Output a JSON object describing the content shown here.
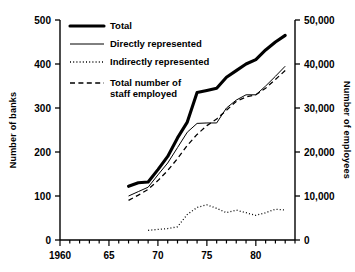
{
  "chart_data": {
    "type": "line",
    "title": "",
    "xlabel": "",
    "ylabel": "Number of banks",
    "y2label": "Number of employees",
    "xlim": [
      1960,
      1984
    ],
    "ylim": [
      0,
      500
    ],
    "y2lim": [
      0,
      50000
    ],
    "grid": false,
    "legend_position": "top-left",
    "xticks": [
      1960,
      1961,
      1962,
      1963,
      1964,
      1965,
      1966,
      1967,
      1968,
      1969,
      1970,
      1971,
      1972,
      1973,
      1974,
      1975,
      1976,
      1977,
      1978,
      1979,
      1980,
      1981,
      1982,
      1983,
      1984
    ],
    "xtick_labels": [
      "1960",
      "",
      "",
      "",
      "",
      "65",
      "",
      "",
      "",
      "",
      "70",
      "",
      "",
      "",
      "",
      "75",
      "",
      "",
      "",
      "",
      "80",
      "",
      "",
      "",
      ""
    ],
    "yticks": [
      0,
      100,
      200,
      300,
      400,
      500
    ],
    "ytick_labels": [
      "0",
      "100",
      "200",
      "300",
      "400",
      "500"
    ],
    "y2ticks": [
      0,
      10000,
      20000,
      30000,
      40000,
      50000
    ],
    "y2tick_labels": [
      "0",
      "10,000",
      "20,000",
      "30,000",
      "40,000",
      "50,000"
    ],
    "series": [
      {
        "name": "Total",
        "style": "thick-solid",
        "axis": "left",
        "x": [
          1967,
          1968,
          1969,
          1970,
          1971,
          1972,
          1973,
          1974,
          1975,
          1976,
          1977,
          1978,
          1979,
          1980,
          1981,
          1982,
          1983
        ],
        "values": [
          122,
          130,
          132,
          160,
          190,
          232,
          268,
          335,
          340,
          345,
          370,
          385,
          400,
          410,
          432,
          450,
          465
        ]
      },
      {
        "name": "Directly represented",
        "style": "thin-solid",
        "axis": "left",
        "x": [
          1967,
          1968,
          1969,
          1970,
          1971,
          1972,
          1973,
          1974,
          1975,
          1976,
          1977,
          1978,
          1979,
          1980,
          1981,
          1982,
          1983
        ],
        "values": [
          100,
          110,
          120,
          148,
          175,
          210,
          245,
          265,
          266,
          266,
          300,
          318,
          330,
          330,
          350,
          372,
          395
        ]
      },
      {
        "name": "Indirectly represented",
        "style": "dotted",
        "axis": "left",
        "x": [
          1969,
          1970,
          1971,
          1972,
          1973,
          1974,
          1975,
          1976,
          1977,
          1978,
          1979,
          1980,
          1981,
          1982,
          1983
        ],
        "values": [
          22,
          24,
          26,
          30,
          58,
          74,
          80,
          72,
          62,
          68,
          62,
          56,
          62,
          70,
          68
        ]
      },
      {
        "name": "Total number of staff employed",
        "style": "dashed",
        "axis": "right",
        "x": [
          1967,
          1968,
          1969,
          1970,
          1971,
          1972,
          1973,
          1974,
          1975,
          1976,
          1977,
          1978,
          1979,
          1980,
          1981,
          1982,
          1983
        ],
        "values": [
          9000,
          10200,
          11500,
          13500,
          15800,
          18500,
          21500,
          24000,
          26000,
          27500,
          29500,
          31500,
          32500,
          33000,
          34500,
          36500,
          38500
        ]
      }
    ]
  },
  "legend": {
    "items": [
      {
        "label": "Total",
        "style": "thick-solid"
      },
      {
        "label": "Directly represented",
        "style": "thin-solid"
      },
      {
        "label": "Indirectly represented",
        "style": "dotted"
      },
      {
        "label": "Total number of\nstaff employed",
        "style": "dashed"
      }
    ],
    "item0": "Total",
    "item1": "Directly represented",
    "item2": "Indirectly represented",
    "item3a": "Total number of",
    "item3b": "staff employed"
  },
  "axes": {
    "left_title": "Number of banks",
    "right_title": "Number of employees"
  },
  "caption": ""
}
